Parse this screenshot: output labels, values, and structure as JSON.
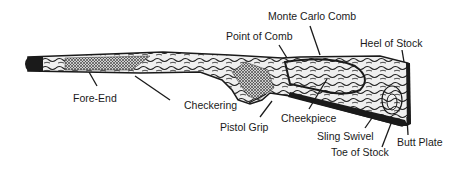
{
  "diagram": {
    "labels": [
      {
        "id": "monte-carlo-comb",
        "text": "Monte Carlo Comb",
        "x": 268,
        "y": 10
      },
      {
        "id": "point-of-comb",
        "text": "Point of Comb",
        "x": 226,
        "y": 30
      },
      {
        "id": "heel-of-stock",
        "text": "Heel of Stock",
        "x": 360,
        "y": 37
      },
      {
        "id": "fore-end",
        "text": "Fore-End",
        "x": 73,
        "y": 92
      },
      {
        "id": "checkering",
        "text": "Checkering",
        "x": 184,
        "y": 99
      },
      {
        "id": "pistol-grip",
        "text": "Pistol Grip",
        "x": 220,
        "y": 121
      },
      {
        "id": "cheekpiece",
        "text": "Cheekpiece",
        "x": 281,
        "y": 112
      },
      {
        "id": "sling-swivel",
        "text": "Sling Swivel",
        "x": 317,
        "y": 130
      },
      {
        "id": "butt-plate",
        "text": "Butt Plate",
        "x": 397,
        "y": 136
      },
      {
        "id": "toe-of-stock",
        "text": "Toe of Stock",
        "x": 331,
        "y": 146
      }
    ],
    "colors": {
      "ink": "#1a1a1a",
      "wood_light": "#e8e8e8",
      "wood_dark": "#2a2a2a",
      "checkering": "#8a8a8a",
      "background": "#ffffff"
    }
  }
}
